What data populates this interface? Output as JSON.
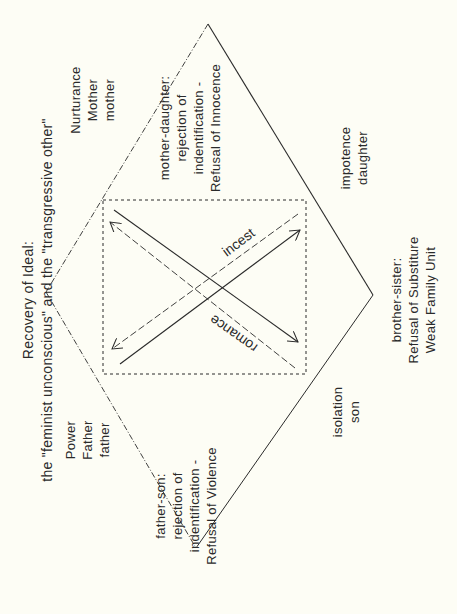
{
  "title": {
    "line1": "Recovery of Ideal:",
    "line2": "the \"feminist unconscious\" and the \"transgressive other\""
  },
  "nodes": {
    "mother": {
      "line1": "Nurturance",
      "line2": "Mother",
      "line3": "mother"
    },
    "father": {
      "line1": "Power",
      "line2": "Father",
      "line3": "father"
    },
    "daughter": {
      "line1": "impotence",
      "line2": "daughter"
    },
    "son": {
      "line1": "isolation",
      "line2": "son"
    }
  },
  "relations": {
    "mother_daughter": {
      "line1": "mother-daughter:",
      "line2": "rejection of",
      "line3": "indentification -",
      "line4": "Refusal of Innocence"
    },
    "father_son": {
      "line1": "father-son:",
      "line2": "rejection of",
      "line3": "indentification -",
      "line4": "Refusal of Violence"
    },
    "brother_sister": {
      "line1": "brother-sister:",
      "line2": "Refusal of Substiture",
      "line3": "Weak Family Unit"
    }
  },
  "center": {
    "incest": "incest",
    "romance": "romance"
  },
  "colors": {
    "background": "#fdfdf5",
    "ink": "#2a2a2a"
  }
}
